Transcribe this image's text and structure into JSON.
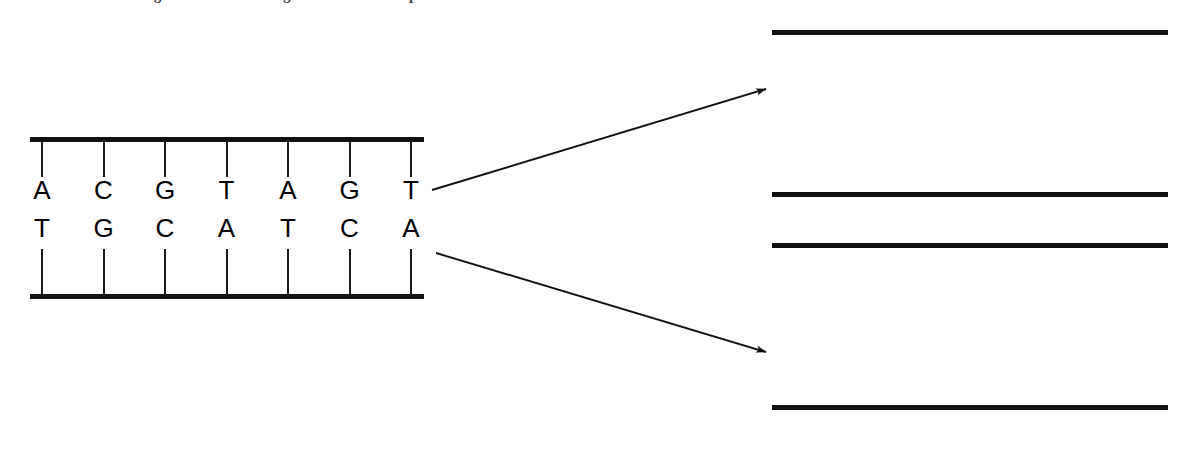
{
  "page": {
    "clipped_running_text": "the right and the resulting new structures represented"
  },
  "figure": {
    "colors": {
      "backbone": "#111111",
      "tick": "#1a1a1a",
      "parental_base": "#000000",
      "nascent_base": "#9b9b9b",
      "arrow": "#111111",
      "background": "#ffffff"
    }
  },
  "chart_data": {
    "type": "diagram",
    "legend": [
      {
        "key": "parental",
        "label": "parental strand",
        "style": "bold black printed letters"
      },
      {
        "key": "nascent",
        "label": "newly synthesized strand",
        "style": "light gray handwritten letters"
      }
    ],
    "duplexes": [
      {
        "id": "parent-duplex",
        "role": "parental double helix",
        "position": "left",
        "strands": [
          {
            "id": "parent-top",
            "origin": "parental",
            "bases": [
              "A",
              "C",
              "G",
              "T",
              "A",
              "G",
              "T"
            ]
          },
          {
            "id": "parent-bottom",
            "origin": "parental",
            "bases": [
              "T",
              "G",
              "C",
              "A",
              "T",
              "C",
              "A"
            ]
          }
        ]
      },
      {
        "id": "daughter-duplex-1",
        "role": "daughter double helix 1",
        "position": "top-right",
        "strands": [
          {
            "id": "daughter1-top",
            "origin": "parental",
            "bases": [
              "A",
              "C",
              "G",
              "T",
              "A",
              "G",
              "T"
            ]
          },
          {
            "id": "daughter1-bottom",
            "origin": "nascent",
            "bases": [
              "T",
              "G",
              "C",
              "A",
              "T",
              "C",
              "A"
            ]
          }
        ]
      },
      {
        "id": "daughter-duplex-2",
        "role": "daughter double helix 2",
        "position": "bottom-right",
        "strands": [
          {
            "id": "daughter2-top",
            "origin": "nascent",
            "bases": [
              "A",
              "C",
              "G",
              "T",
              "A",
              "G",
              "T"
            ]
          },
          {
            "id": "daughter2-bottom",
            "origin": "parental",
            "bases": [
              "T",
              "G",
              "C",
              "A",
              "T",
              "C",
              "A"
            ]
          }
        ]
      }
    ],
    "arrows": [
      {
        "id": "arrow-upper",
        "from": "parent-duplex top strand 3' end",
        "to": "daughter-duplex-1",
        "direction": "up-right"
      },
      {
        "id": "arrow-lower",
        "from": "parent-duplex bottom strand 3' end",
        "to": "daughter-duplex-2",
        "direction": "down-right"
      }
    ],
    "base_count": 7
  }
}
